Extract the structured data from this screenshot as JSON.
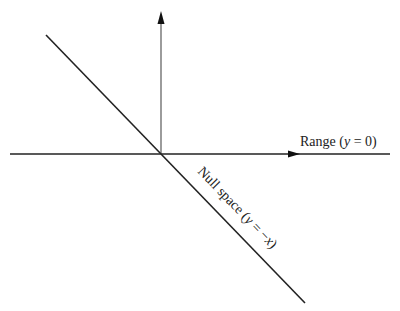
{
  "diagram": {
    "labels": {
      "range": {
        "prefix": "Range (",
        "var": "y",
        "eq": " = 0)"
      },
      "null_space": {
        "prefix": "Null space (",
        "var": "y",
        "eq": " = −",
        "var2": "x",
        "suffix": ")"
      }
    },
    "colors": {
      "line": "#222222",
      "axis_vertical": "#555555",
      "background": "#ffffff"
    },
    "elements": [
      {
        "type": "axis",
        "direction": "horizontal",
        "from": [
          10,
          154
        ],
        "to": [
          390,
          154
        ],
        "arrow_at": [
          296,
          154
        ]
      },
      {
        "type": "axis",
        "direction": "vertical",
        "from": [
          161,
          154
        ],
        "to": [
          161,
          12
        ],
        "arrow_at": [
          161,
          12
        ]
      },
      {
        "type": "line",
        "name": "null-space-line",
        "from": [
          46,
          35
        ],
        "to": [
          305,
          303
        ]
      }
    ]
  }
}
